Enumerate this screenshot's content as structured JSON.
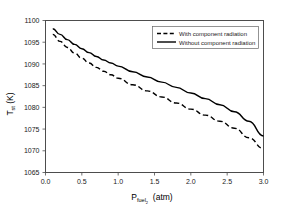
{
  "chart_data": {
    "type": "line",
    "title": "",
    "xlabel": "P_fuel (atm)",
    "xlabel_main": "P",
    "xlabel_sub": "fuel",
    "xlabel_subsub": "2",
    "xlabel_unit": "(atm)",
    "ylabel": "T_st (K)",
    "ylabel_main": "T",
    "ylabel_sub": "st",
    "ylabel_unit": "(K)",
    "xlim": [
      0.0,
      3.0
    ],
    "ylim": [
      1065,
      1100
    ],
    "xticks": [
      "0.0",
      "0.5",
      "1.0",
      "1.5",
      "2.0",
      "2.5",
      "3.0"
    ],
    "xtick_values": [
      0.0,
      0.5,
      1.0,
      1.5,
      2.0,
      2.5,
      3.0
    ],
    "yticks": [
      "1065",
      "1070",
      "1075",
      "1080",
      "1085",
      "1090",
      "1095",
      "1100"
    ],
    "ytick_values": [
      1065,
      1070,
      1075,
      1080,
      1085,
      1090,
      1095,
      1100
    ],
    "grid": false,
    "legend_position": "top-right",
    "x": [
      0.1,
      0.2,
      0.3,
      0.4,
      0.5,
      0.6,
      0.7,
      0.8,
      0.9,
      1.0,
      1.2,
      1.4,
      1.6,
      1.8,
      2.0,
      2.2,
      2.4,
      2.6,
      2.8,
      3.0
    ],
    "series": [
      {
        "name": "With component radiation",
        "style": "dashed",
        "color": "#000000",
        "values": [
          1096.8,
          1095.2,
          1093.8,
          1092.5,
          1091.3,
          1090.2,
          1089.2,
          1088.3,
          1087.5,
          1086.7,
          1085.2,
          1083.8,
          1082.4,
          1081.0,
          1079.6,
          1078.2,
          1076.8,
          1075.2,
          1073.0,
          1070.5
        ]
      },
      {
        "name": "Without component radiation",
        "style": "solid",
        "color": "#000000",
        "values": [
          1098.1,
          1096.8,
          1095.6,
          1094.5,
          1093.5,
          1092.6,
          1091.7,
          1090.9,
          1090.2,
          1089.5,
          1088.2,
          1087.0,
          1085.8,
          1084.6,
          1083.3,
          1082.0,
          1080.6,
          1079.0,
          1076.8,
          1073.4
        ]
      }
    ]
  },
  "legend": {
    "entries": [
      {
        "label": "With component radiation",
        "style": "dashed"
      },
      {
        "label": "Without component radiation",
        "style": "solid"
      }
    ]
  }
}
